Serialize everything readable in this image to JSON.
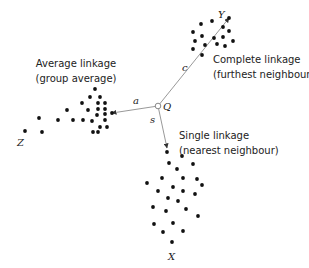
{
  "diagram": {
    "point_q": {
      "label": "Q",
      "x": 158,
      "y": 106
    },
    "clusters": [
      {
        "id": "Z",
        "label": "Z",
        "label_pos": [
          17,
          146
        ],
        "method_line1": "Average linkage",
        "method_line2": "(group average)",
        "method_pos": [
          75,
          80
        ],
        "link_label": "a",
        "link_label_pos": [
          135,
          104
        ],
        "link_end": [
          112,
          113
        ],
        "points": [
          [
            95,
            89
          ],
          [
            90,
            97
          ],
          [
            100,
            97
          ],
          [
            98,
            103
          ],
          [
            105,
            103
          ],
          [
            82,
            103
          ],
          [
            88,
            110
          ],
          [
            98,
            109
          ],
          [
            105,
            109
          ],
          [
            97,
            115
          ],
          [
            105,
            114
          ],
          [
            112,
            113
          ],
          [
            83,
            120
          ],
          [
            92,
            121
          ],
          [
            105,
            120
          ],
          [
            100,
            127
          ],
          [
            107,
            127
          ],
          [
            93,
            132
          ],
          [
            98,
            132
          ],
          [
            25,
            131
          ],
          [
            39,
            118
          ],
          [
            42,
            132
          ],
          [
            58,
            120
          ],
          [
            67,
            110
          ],
          [
            73,
            120
          ]
        ]
      },
      {
        "id": "Y",
        "label": "Y",
        "label_pos": [
          218,
          18
        ],
        "method_line1": "Complete linkage",
        "method_line2": "(furthest neighbour)",
        "method_pos": [
          212,
          63
        ],
        "link_label": "c",
        "link_label_pos": [
          182,
          71
        ],
        "link_end": [
          229,
          18
        ],
        "points": [
          [
            229,
            18
          ],
          [
            223,
            27
          ],
          [
            212,
            21
          ],
          [
            201,
            24
          ],
          [
            193,
            32
          ],
          [
            202,
            36
          ],
          [
            229,
            31
          ],
          [
            214,
            38
          ],
          [
            223,
            37
          ],
          [
            233,
            41
          ],
          [
            195,
            41
          ],
          [
            205,
            45
          ],
          [
            217,
            44
          ],
          [
            225,
            46
          ],
          [
            193,
            49
          ],
          [
            202,
            55
          ]
        ]
      },
      {
        "id": "X",
        "label": "X",
        "label_pos": [
          172,
          256
        ],
        "method_line1": "Single linkage",
        "method_line2": "(nearest neighbour)",
        "method_pos": [
          179,
          137
        ],
        "link_label": "s",
        "link_label_pos": [
          151,
          122
        ],
        "link_end": [
          167,
          148
        ],
        "points": [
          [
            167,
            152
          ],
          [
            182,
            156
          ],
          [
            169,
            163
          ],
          [
            193,
            164
          ],
          [
            177,
            169
          ],
          [
            162,
            178
          ],
          [
            183,
            178
          ],
          [
            197,
            179
          ],
          [
            147,
            183
          ],
          [
            202,
            185
          ],
          [
            158,
            191
          ],
          [
            173,
            187
          ],
          [
            183,
            191
          ],
          [
            195,
            194
          ],
          [
            168,
            198
          ],
          [
            178,
            201
          ],
          [
            153,
            207
          ],
          [
            166,
            211
          ],
          [
            186,
            209
          ],
          [
            198,
            216
          ],
          [
            154,
            224
          ],
          [
            173,
            223
          ],
          [
            163,
            232
          ],
          [
            183,
            231
          ],
          [
            172,
            242
          ]
        ]
      }
    ],
    "colors": {
      "dot": "#111111",
      "line": "#999999",
      "text": "#222222",
      "background": "#ffffff"
    }
  }
}
